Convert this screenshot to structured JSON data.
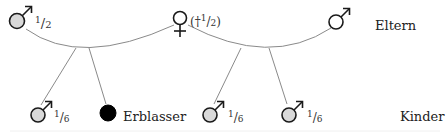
{
  "diagram": {
    "type": "inheritance-family-tree",
    "colors": {
      "line": "#8a8a8a",
      "symbol_stroke": "#1a1a1a",
      "heir_fill": "#d9d9d9",
      "decedent_fill": "#000000",
      "text": "#222222"
    },
    "row_labels": {
      "parents": "Eltern",
      "children": "Kinder"
    },
    "parents": [
      {
        "id": "father1",
        "symbol": "male",
        "share_num": "1",
        "share_den": "2",
        "prefix": "",
        "suffix": ""
      },
      {
        "id": "mother",
        "symbol": "female",
        "share_prefix": "(†",
        "share_num": "1",
        "share_den": "2",
        "share_suffix": ")"
      },
      {
        "id": "father2",
        "symbol": "male",
        "share_num": "",
        "share_den": ""
      }
    ],
    "children": [
      {
        "id": "child1",
        "symbol": "male",
        "share_num": "1",
        "share_den": "6"
      },
      {
        "id": "decedent",
        "symbol": "filled-circle",
        "label": "Erblasser"
      },
      {
        "id": "child3",
        "symbol": "male",
        "share_num": "1",
        "share_den": "6"
      },
      {
        "id": "child4",
        "symbol": "male",
        "share_num": "1",
        "share_den": "6"
      }
    ],
    "fraction_slash": "/"
  }
}
